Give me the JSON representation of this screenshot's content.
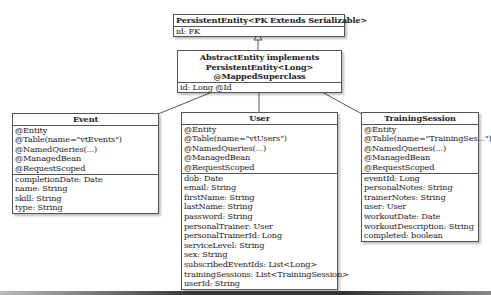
{
  "diagram": {
    "type": "uml-class-diagram",
    "classes": {
      "persistent_entity": {
        "name": "PersistentEntity<PK Extends Serializable>",
        "attributes": [
          "id: PK"
        ]
      },
      "abstract_entity": {
        "name_lines": [
          "AbstractEntity implements",
          "PersistentEntity<Long>",
          "@MappedSuperclass"
        ],
        "attributes": [
          "id: Long @Id"
        ]
      },
      "event": {
        "name": "Event",
        "annotations": [
          "@Entity",
          "@Table(name=\"vtEvents\")",
          "@NamedQueries(...)",
          "@ManagedBean",
          "@RequestScoped"
        ],
        "attributes": [
          "completionDate: Date",
          "name: String",
          "skill: String",
          "type: String"
        ]
      },
      "user": {
        "name": "User",
        "annotations": [
          "@Entity",
          "@Table(name=\"vtUsers\")",
          "@NamedQueries(...)",
          "@ManagedBean",
          "@RequestScoped"
        ],
        "attributes": [
          "dob: Date",
          "email: String",
          "firstName: String",
          "lastName: String",
          "password: String",
          "personalTrainer: User",
          "personalTrainerId: Long",
          "serviceLevel: String",
          "sex: String",
          "subscribedEventIds: List<Long>",
          "trainingSessions: List<TrainingSession>",
          "userId: String"
        ]
      },
      "training_session": {
        "name": "TrainingSession",
        "annotations": [
          "@Entity",
          "@Table(name=\"TrainingSes...\")",
          "@NamedQueries(...)",
          "@ManagedBean",
          "@RequestScoped"
        ],
        "attributes": [
          "eventId: Long",
          "personalNotes: String",
          "trainerNotes: String",
          "user: User",
          "workoutDate: Date",
          "workoutDescription: String",
          "completed: boolean"
        ]
      }
    },
    "relationships": [
      {
        "from": "AbstractEntity",
        "to": "PersistentEntity<PK Extends Serializable>",
        "type": "generalization"
      },
      {
        "from": "Event",
        "to": "AbstractEntity",
        "type": "generalization"
      },
      {
        "from": "User",
        "to": "AbstractEntity",
        "type": "generalization"
      },
      {
        "from": "TrainingSession",
        "to": "AbstractEntity",
        "type": "generalization"
      }
    ]
  }
}
